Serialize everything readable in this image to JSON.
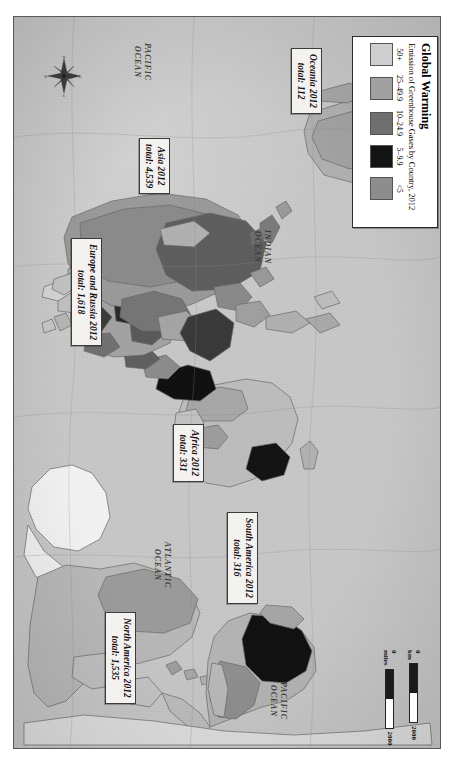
{
  "map": {
    "title": "Global Warming map plate",
    "background_color": "#c8c8c8",
    "frame_color": "#5a5a5a"
  },
  "legend": {
    "title": "Global Warming",
    "subtitle": "Emission of Greenhouse Gases by Country, 2012",
    "classes": [
      {
        "label": "50+",
        "color": "#cfcfcf"
      },
      {
        "label": "25–49.9",
        "color": "#a0a0a0"
      },
      {
        "label": "10–24.9",
        "color": "#6f6f6f"
      },
      {
        "label": "5–9.9",
        "color": "#141414"
      },
      {
        "label": "<5",
        "color": "#8d8d8d"
      }
    ]
  },
  "region_callouts": [
    {
      "name": "oceania",
      "line1": "Oceania 2012",
      "line2": "total: 112"
    },
    {
      "name": "asia",
      "line1": "Asia 2012",
      "line2": "total: 4,539"
    },
    {
      "name": "europe-russia",
      "line1": "Europe and Russia 2012",
      "line2": "total: 1,618"
    },
    {
      "name": "africa",
      "line1": "Africa 2012",
      "line2": "total: 331"
    },
    {
      "name": "south-america",
      "line1": "South America 2012",
      "line2": "total: 316"
    },
    {
      "name": "north-america",
      "line1": "North America 2012",
      "line2": "total: 1,535"
    }
  ],
  "ocean_labels": [
    {
      "name": "pacific-north",
      "line1": "PACIFIC",
      "line2": "OCEAN"
    },
    {
      "name": "indian",
      "line1": "INDIAN",
      "line2": "OCEAN"
    },
    {
      "name": "atlantic",
      "line1": "ATLANTIC",
      "line2": "OCEAN"
    },
    {
      "name": "pacific-south",
      "line1": "PACIFIC",
      "line2": "OCEAN"
    }
  ],
  "scale_bar": {
    "km_start": "0 km",
    "km_end": "2000",
    "miles_start": "0 miles",
    "miles_end": "2000"
  },
  "compass": {
    "north": "N",
    "south": "S",
    "east": "E",
    "west": "W"
  }
}
